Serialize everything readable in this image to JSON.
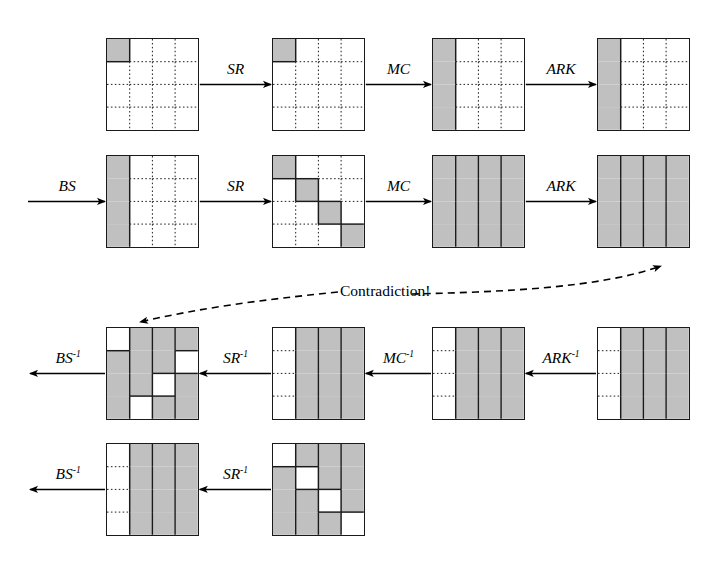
{
  "figure": {
    "contradiction_label": "Contradiction!",
    "grid": {
      "rows": 4,
      "cols": 4
    },
    "colors": {
      "active_cell": "#c0c0c0",
      "inactive_cell": "#ffffff",
      "border": "#1a1a1a",
      "line": "#000000"
    }
  },
  "rows": [
    {
      "id": "row-1-forward-top",
      "operations": [
        {
          "id": "op-sr-r1",
          "label": "SR",
          "superscript": ""
        },
        {
          "id": "op-mc-r1",
          "label": "MC",
          "superscript": ""
        },
        {
          "id": "op-ark-r1",
          "label": "ARK",
          "superscript": ""
        }
      ],
      "states": [
        {
          "id": "state-r1-s1",
          "name": "input-state",
          "pattern": "single-cell-top-left",
          "active_cells": [
            [
              0,
              0
            ]
          ]
        },
        {
          "id": "state-r1-s2",
          "name": "after-sr",
          "pattern": "single-cell-top-left",
          "active_cells": [
            [
              0,
              0
            ]
          ]
        },
        {
          "id": "state-r1-s3",
          "name": "after-mc",
          "pattern": "first-column",
          "active_cells": [
            [
              0,
              0
            ],
            [
              1,
              0
            ],
            [
              2,
              0
            ],
            [
              3,
              0
            ]
          ]
        },
        {
          "id": "state-r1-s4",
          "name": "after-ark",
          "pattern": "first-column",
          "active_cells": [
            [
              0,
              0
            ],
            [
              1,
              0
            ],
            [
              2,
              0
            ],
            [
              3,
              0
            ]
          ]
        }
      ]
    },
    {
      "id": "row-2-forward-bottom",
      "operations": [
        {
          "id": "op-bs-r2",
          "label": "BS",
          "superscript": ""
        },
        {
          "id": "op-sr-r2",
          "label": "SR",
          "superscript": ""
        },
        {
          "id": "op-mc-r2",
          "label": "MC",
          "superscript": ""
        },
        {
          "id": "op-ark-r2",
          "label": "ARK",
          "superscript": ""
        }
      ],
      "states": [
        {
          "id": "state-r2-s1",
          "name": "after-bs",
          "pattern": "first-column",
          "active_cells": [
            [
              0,
              0
            ],
            [
              1,
              0
            ],
            [
              2,
              0
            ],
            [
              3,
              0
            ]
          ]
        },
        {
          "id": "state-r2-s2",
          "name": "after-sr",
          "pattern": "diagonal",
          "active_cells": [
            [
              0,
              0
            ],
            [
              1,
              1
            ],
            [
              2,
              2
            ],
            [
              3,
              3
            ]
          ]
        },
        {
          "id": "state-r2-s3",
          "name": "after-mc",
          "pattern": "all-active",
          "active_cells": "all"
        },
        {
          "id": "state-r2-s4",
          "name": "after-ark",
          "pattern": "all-active",
          "active_cells": "all"
        }
      ]
    },
    {
      "id": "row-3-backward-top",
      "operations": [
        {
          "id": "op-bs-inv-r3",
          "label": "BS",
          "superscript": "-1"
        },
        {
          "id": "op-sr-inv-r3",
          "label": "SR",
          "superscript": "-1"
        },
        {
          "id": "op-mc-inv-r3",
          "label": "MC",
          "superscript": "-1"
        },
        {
          "id": "op-ark-inv-r3",
          "label": "ARK",
          "superscript": "-1"
        }
      ],
      "states": [
        {
          "id": "state-r3-s1",
          "name": "before-bs-inverse",
          "pattern": "inverse-shifted-diagonal",
          "inactive_cells": [
            [
              0,
              0
            ],
            [
              1,
              3
            ],
            [
              2,
              2
            ],
            [
              3,
              1
            ]
          ]
        },
        {
          "id": "state-r3-s2",
          "name": "before-sr-inverse",
          "pattern": "columns-2-3-4",
          "active_cells": [
            [
              0,
              1
            ],
            [
              0,
              2
            ],
            [
              0,
              3
            ],
            [
              1,
              1
            ],
            [
              1,
              2
            ],
            [
              1,
              3
            ],
            [
              2,
              1
            ],
            [
              2,
              2
            ],
            [
              2,
              3
            ],
            [
              3,
              1
            ],
            [
              3,
              2
            ],
            [
              3,
              3
            ]
          ]
        },
        {
          "id": "state-r3-s3",
          "name": "before-mc-inverse",
          "pattern": "columns-2-3-4",
          "active_cells": [
            [
              0,
              1
            ],
            [
              0,
              2
            ],
            [
              0,
              3
            ],
            [
              1,
              1
            ],
            [
              1,
              2
            ],
            [
              1,
              3
            ],
            [
              2,
              1
            ],
            [
              2,
              2
            ],
            [
              2,
              3
            ],
            [
              3,
              1
            ],
            [
              3,
              2
            ],
            [
              3,
              3
            ]
          ]
        },
        {
          "id": "state-r3-s4",
          "name": "before-ark-inverse",
          "pattern": "columns-2-3-4",
          "active_cells": [
            [
              0,
              1
            ],
            [
              0,
              2
            ],
            [
              0,
              3
            ],
            [
              1,
              1
            ],
            [
              1,
              2
            ],
            [
              1,
              3
            ],
            [
              2,
              1
            ],
            [
              2,
              2
            ],
            [
              2,
              3
            ],
            [
              3,
              1
            ],
            [
              3,
              2
            ],
            [
              3,
              3
            ]
          ]
        }
      ]
    },
    {
      "id": "row-4-backward-bottom",
      "operations": [
        {
          "id": "op-bs-inv-r4",
          "label": "BS",
          "superscript": "-1"
        },
        {
          "id": "op-sr-inv-r4",
          "label": "SR",
          "superscript": "-1"
        }
      ],
      "states": [
        {
          "id": "state-r4-s1",
          "name": "before-bs-inverse",
          "pattern": "columns-2-3-4",
          "active_cells": [
            [
              0,
              1
            ],
            [
              0,
              2
            ],
            [
              0,
              3
            ],
            [
              1,
              1
            ],
            [
              1,
              2
            ],
            [
              1,
              3
            ],
            [
              2,
              1
            ],
            [
              2,
              2
            ],
            [
              2,
              3
            ],
            [
              3,
              1
            ],
            [
              3,
              2
            ],
            [
              3,
              3
            ]
          ]
        },
        {
          "id": "state-r4-s2",
          "name": "before-sr-inverse",
          "pattern": "inverse-diagonal",
          "inactive_cells": [
            [
              0,
              0
            ],
            [
              1,
              1
            ],
            [
              2,
              2
            ],
            [
              3,
              3
            ]
          ]
        }
      ]
    }
  ]
}
